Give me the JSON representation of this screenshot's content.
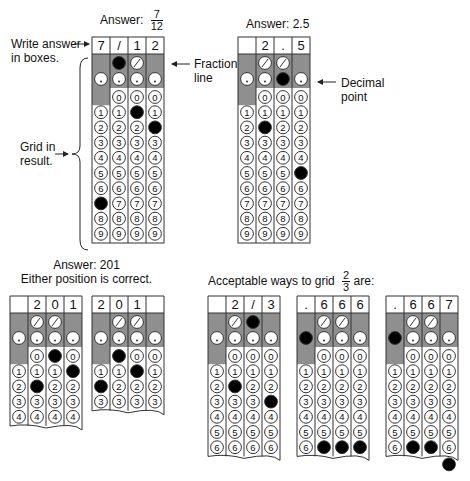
{
  "colors": {
    "shade": "#8f8f8f",
    "line": "#333333",
    "bubble_fill": "#ffffff",
    "filled": "#000000",
    "text": "#111111"
  },
  "top": {
    "example1": {
      "answer_label": "Answer:",
      "answer_numerator": "7",
      "answer_denominator": "12",
      "annotations": {
        "write_answer": [
          "Write answer",
          "in boxes."
        ],
        "fraction_line": [
          "Fraction",
          "line"
        ],
        "grid_in": [
          "Grid in",
          "result."
        ]
      }
    },
    "example2": {
      "answer_label": "Answer: 2.5",
      "annotations": {
        "decimal_point": [
          "Decimal",
          "point"
        ]
      }
    }
  },
  "bottom": {
    "example3": {
      "answer_label": "Answer: 201",
      "note": "Either position is correct."
    },
    "example4": {
      "label_prefix": "Acceptable ways to grid",
      "label_numerator": "2",
      "label_denominator": "3",
      "label_suffix": "are:"
    }
  },
  "grids": [
    {
      "id": "grid-7-12",
      "x": 92,
      "y": 37,
      "rows": 10,
      "boxes": [
        "7",
        "/",
        "1",
        "2"
      ],
      "filled": [
        [
          0,
          7
        ],
        [
          1,
          "/"
        ],
        [
          2,
          1
        ],
        [
          3,
          2
        ]
      ],
      "torn": false
    },
    {
      "id": "grid-2-5",
      "x": 238,
      "y": 37,
      "rows": 10,
      "boxes": [
        "",
        "2",
        ".",
        "5"
      ],
      "filled": [
        [
          1,
          2
        ],
        [
          2,
          "."
        ],
        [
          3,
          5
        ]
      ],
      "torn": false
    },
    {
      "id": "grid-201-a",
      "x": 10,
      "y": 296,
      "rows": 5,
      "boxes": [
        "",
        "2",
        "0",
        "1"
      ],
      "filled": [
        [
          1,
          2
        ],
        [
          2,
          0
        ],
        [
          3,
          1
        ]
      ],
      "torn": true
    },
    {
      "id": "grid-201-b",
      "x": 92,
      "y": 296,
      "rows": 4,
      "boxes": [
        "2",
        "0",
        "1",
        ""
      ],
      "filled": [
        [
          0,
          2
        ],
        [
          1,
          0
        ],
        [
          2,
          1
        ]
      ],
      "torn": true
    },
    {
      "id": "grid-2-slash-3",
      "x": 208,
      "y": 296,
      "rows": 7,
      "boxes": [
        "",
        "2",
        "/",
        "3"
      ],
      "filled": [
        [
          1,
          2
        ],
        [
          2,
          "/"
        ],
        [
          3,
          3
        ]
      ],
      "torn": true
    },
    {
      "id": "grid-666",
      "x": 297,
      "y": 296,
      "rows": 7,
      "boxes": [
        ".",
        "6",
        "6",
        "6"
      ],
      "filled": [
        [
          0,
          "."
        ],
        [
          1,
          6
        ],
        [
          2,
          6
        ],
        [
          3,
          6
        ]
      ],
      "torn": true
    },
    {
      "id": "grid-667",
      "x": 386,
      "y": 296,
      "rows": 7,
      "boxes": [
        ".",
        "6",
        "6",
        "7"
      ],
      "filled": [
        [
          0,
          "."
        ],
        [
          1,
          6
        ],
        [
          2,
          6
        ],
        [
          3,
          7
        ]
      ],
      "torn": true,
      "overflow_bubble": {
        "col": 3,
        "digit": 7
      }
    }
  ]
}
